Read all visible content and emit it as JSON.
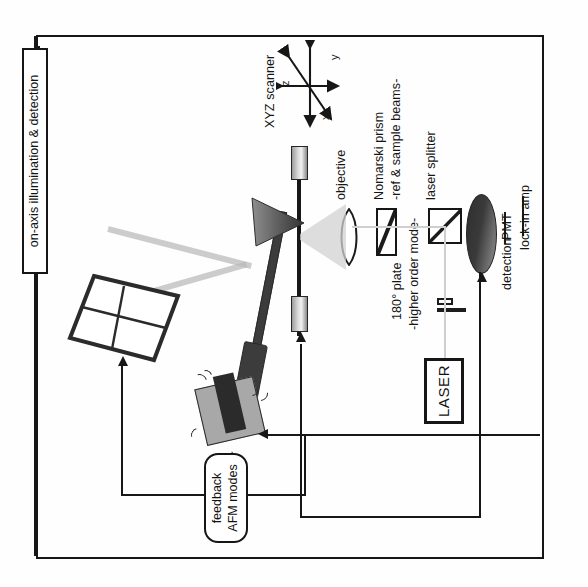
{
  "figure": {
    "type": "optical-afm-schematic",
    "background": "#ffffff",
    "ink_color": "#161616",
    "beam_color": "#b9b9b9"
  },
  "labels": {
    "on_axis": "on-axis illumination & detection",
    "xyz_scanner": "XYZ scanner",
    "axis_z": "z",
    "axis_y": "y",
    "axis_x": "x",
    "objective": "objective",
    "nomarski_line1": "Nomarski prism",
    "nomarski_line2": "-ref & sample beams-",
    "laser_splitter": "laser splitter",
    "plate_line1": "180° plate",
    "plate_line2": "-higher order mode-",
    "laser": "LASER",
    "detection": "detection",
    "pmt": "PMT",
    "lockin": "lock-in amp",
    "feedback_line1": "feedback",
    "feedback_line2": "AFM modes"
  },
  "components": [
    {
      "id": "on-axis-illumination-box",
      "label": "on-axis illumination & detection",
      "shape": "tall-rect"
    },
    {
      "id": "quadrant-photodiode",
      "label": "",
      "shape": "four-segment-detector"
    },
    {
      "id": "afm-cantilever",
      "label": "",
      "shape": "cantilever-with-tip"
    },
    {
      "id": "cantilever-holder",
      "label": "",
      "shape": "vibrating-block"
    },
    {
      "id": "sample-stage",
      "label": "",
      "shape": "vertical-bar"
    },
    {
      "id": "objective-lens",
      "label": "objective",
      "shape": "biconvex-lens"
    },
    {
      "id": "nomarski-prism",
      "label": "Nomarski prism -ref & sample beams-",
      "shape": "rect-with-diagonal"
    },
    {
      "id": "laser-splitter",
      "label": "laser splitter",
      "shape": "square-with-diagonal"
    },
    {
      "id": "half-wave-plate",
      "label": "180° plate -higher order mode-",
      "shape": "thin-plate-pair"
    },
    {
      "id": "laser-source",
      "label": "LASER",
      "shape": "boxed-text"
    },
    {
      "id": "pmt-detector",
      "label": "PMT",
      "shape": "dark-cylinder"
    },
    {
      "id": "feedback-controller",
      "label": "feedback AFM modes",
      "shape": "rounded-rect"
    }
  ],
  "signal_paths": [
    {
      "from": "quadrant-photodiode",
      "to": "feedback-controller",
      "kind": "electrical"
    },
    {
      "from": "feedback-controller",
      "to": "cantilever-holder",
      "kind": "electrical"
    },
    {
      "from": "pmt-detector",
      "to": "sample-stage",
      "kind": "electrical"
    },
    {
      "from": "laser-source",
      "to": "half-wave-plate",
      "kind": "optical"
    },
    {
      "from": "on-axis-illumination-box",
      "to": "frame-top",
      "kind": "electrical"
    }
  ]
}
